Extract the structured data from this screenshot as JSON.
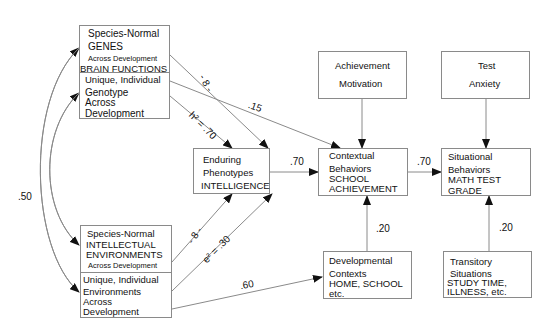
{
  "diagram": {
    "type": "path-model",
    "nodes": {
      "genes_box": {
        "top": {
          "line1": "Species-Normal",
          "line2": "GENES",
          "line3": "Across Development",
          "line4": "BRAIN FUNCTIONS"
        },
        "bottom": {
          "line1": "Unique, Individual",
          "line2": "Genotype",
          "line3": "Across",
          "line4": "Development"
        }
      },
      "environments_box": {
        "top": {
          "line1": "Species-Normal",
          "line2": "INTELLECTUAL",
          "line3": "ENVIRONMENTS",
          "line4": "Across Development"
        },
        "bottom": {
          "line1": "Unique, Individual",
          "line2": "Environments",
          "line3": "Across",
          "line4": "Development"
        }
      },
      "phenotypes": {
        "line1": "Enduring",
        "line2": "Phenotypes",
        "line3": "INTELLIGENCE"
      },
      "achievement_motivation": {
        "line1": "Achievement",
        "line2": "Motivation"
      },
      "test_anxiety": {
        "line1": "Test",
        "line2": "Anxiety"
      },
      "contextual_behaviors": {
        "line1": "Contextual",
        "line2": "Behaviors",
        "line3": "SCHOOL",
        "line4": "ACHIEVEMENT"
      },
      "situational_behaviors": {
        "line1": "Situational",
        "line2": "Behaviors",
        "line3": "MATH TEST",
        "line4": "GRADE"
      },
      "developmental_contexts": {
        "line1": "Developmental",
        "line2": "Contexts",
        "line3": "HOME, SCHOOL",
        "line4": "etc."
      },
      "transitory_situations": {
        "line1": "Transitory",
        "line2": "Situations",
        "line3": "STUDY TIME,",
        "line4": "ILLNESS, etc."
      }
    },
    "edge_labels": {
      "genes_correlation": ".50",
      "g_upper": "- 8 -",
      "h2": "h² = .70",
      "genotype_to_contextual": ".15",
      "g_lower": "- 8 -",
      "e2": "e² = .30",
      "env_to_developmental": ".60",
      "phenotypes_to_contextual": ".70",
      "contextual_to_situational": ".70",
      "developmental_to_contextual": ".20",
      "transitory_to_situational": ".20"
    },
    "line_color": "#8a8a8a",
    "arrow_color": "#111111"
  }
}
